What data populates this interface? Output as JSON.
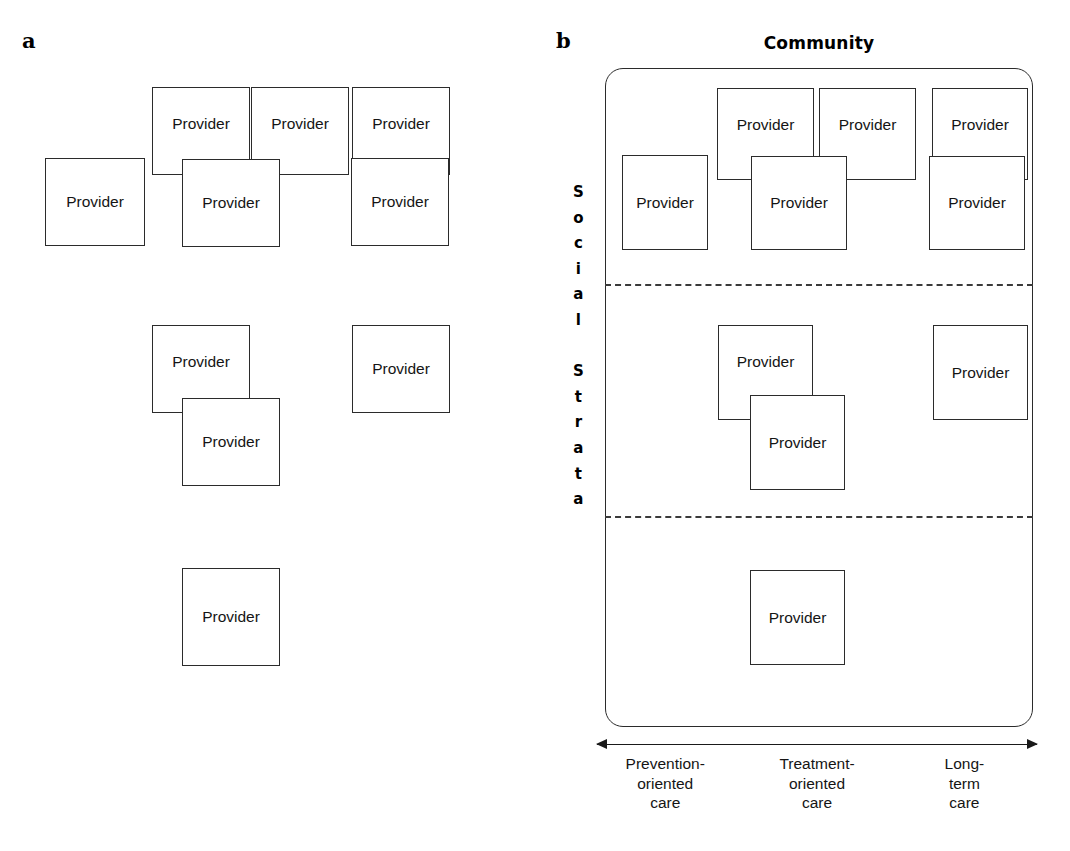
{
  "figure": {
    "width": 1070,
    "height": 851,
    "background": "#ffffff",
    "line_color": "#2b2b2b",
    "text_color": "#151515"
  },
  "panel_a": {
    "label": "a",
    "provider_label": "Provider",
    "boxes": [
      {
        "id": "a-r1-1",
        "label": "Provider",
        "x": 45,
        "y": 158,
        "w": 100,
        "h": 88,
        "align": "mid",
        "z": 2
      },
      {
        "id": "a-r1-2",
        "label": "Provider",
        "x": 152,
        "y": 87,
        "w": 98,
        "h": 88,
        "align": "upper",
        "z": 1
      },
      {
        "id": "a-r1-3",
        "label": "Provider",
        "x": 251,
        "y": 87,
        "w": 98,
        "h": 88,
        "align": "upper",
        "z": 1
      },
      {
        "id": "a-r1-4",
        "label": "Provider",
        "x": 182,
        "y": 159,
        "w": 98,
        "h": 88,
        "align": "mid",
        "z": 4
      },
      {
        "id": "a-r1-5",
        "label": "Provider",
        "x": 352,
        "y": 87,
        "w": 98,
        "h": 88,
        "align": "upper",
        "z": 1
      },
      {
        "id": "a-r1-6",
        "label": "Provider",
        "x": 351,
        "y": 158,
        "w": 98,
        "h": 88,
        "align": "mid",
        "z": 4
      },
      {
        "id": "a-r2-1",
        "label": "Provider",
        "x": 152,
        "y": 325,
        "w": 98,
        "h": 88,
        "align": "upper",
        "z": 1
      },
      {
        "id": "a-r2-2",
        "label": "Provider",
        "x": 182,
        "y": 398,
        "w": 98,
        "h": 88,
        "align": "mid",
        "z": 4
      },
      {
        "id": "a-r2-3",
        "label": "Provider",
        "x": 352,
        "y": 325,
        "w": 98,
        "h": 88,
        "align": "mid",
        "z": 2
      },
      {
        "id": "a-r3-1",
        "label": "Provider",
        "x": 182,
        "y": 568,
        "w": 98,
        "h": 98,
        "align": "mid",
        "z": 2
      }
    ]
  },
  "panel_b": {
    "label": "b",
    "community_title": "Community",
    "provider_label": "Provider",
    "social_strata_letters": [
      "S",
      "o",
      "c",
      "i",
      "a",
      "l",
      "",
      "S",
      "t",
      "r",
      "a",
      "t",
      "a"
    ],
    "social_strata_text": "Social Strata",
    "container": {
      "x": 605,
      "y": 68,
      "w": 428,
      "h": 659,
      "radius": 18
    },
    "strata_dividers": [
      {
        "id": "divider-top",
        "y": 284
      },
      {
        "id": "divider-bottom",
        "y": 516
      }
    ],
    "boxes": [
      {
        "id": "b-r1-1",
        "label": "Provider",
        "x": 622,
        "y": 155,
        "w": 86,
        "h": 95,
        "align": "mid",
        "z": 2
      },
      {
        "id": "b-r1-2",
        "label": "Provider",
        "x": 717,
        "y": 88,
        "w": 97,
        "h": 92,
        "align": "upper",
        "z": 1
      },
      {
        "id": "b-r1-3",
        "label": "Provider",
        "x": 819,
        "y": 88,
        "w": 97,
        "h": 92,
        "align": "upper",
        "z": 1
      },
      {
        "id": "b-r1-4",
        "label": "Provider",
        "x": 751,
        "y": 156,
        "w": 96,
        "h": 94,
        "align": "mid",
        "z": 4
      },
      {
        "id": "b-r1-5",
        "label": "Provider",
        "x": 932,
        "y": 88,
        "w": 96,
        "h": 92,
        "align": "upper",
        "z": 1
      },
      {
        "id": "b-r1-6",
        "label": "Provider",
        "x": 929,
        "y": 156,
        "w": 96,
        "h": 94,
        "align": "mid",
        "z": 4
      },
      {
        "id": "b-r2-1",
        "label": "Provider",
        "x": 718,
        "y": 325,
        "w": 95,
        "h": 95,
        "align": "upper",
        "z": 1
      },
      {
        "id": "b-r2-2",
        "label": "Provider",
        "x": 750,
        "y": 395,
        "w": 95,
        "h": 95,
        "align": "mid",
        "z": 4
      },
      {
        "id": "b-r2-3",
        "label": "Provider",
        "x": 933,
        "y": 325,
        "w": 95,
        "h": 95,
        "align": "mid",
        "z": 2
      },
      {
        "id": "b-r3-1",
        "label": "Provider",
        "x": 750,
        "y": 570,
        "w": 95,
        "h": 95,
        "align": "mid",
        "z": 2
      }
    ],
    "axis": {
      "x": 597,
      "y": 744,
      "width": 440,
      "left_arrow": "arrow-left",
      "right_arrow": "arrow-right",
      "ticks": [
        {
          "id": "tick-prevention",
          "lines": [
            "Prevention-",
            "oriented",
            "care"
          ],
          "center": 0.155
        },
        {
          "id": "tick-treatment",
          "lines": [
            "Treatment-",
            "oriented",
            "care"
          ],
          "center": 0.5
        },
        {
          "id": "tick-longterm",
          "lines": [
            "Long-",
            "term",
            "care"
          ],
          "center": 0.835
        }
      ]
    }
  }
}
